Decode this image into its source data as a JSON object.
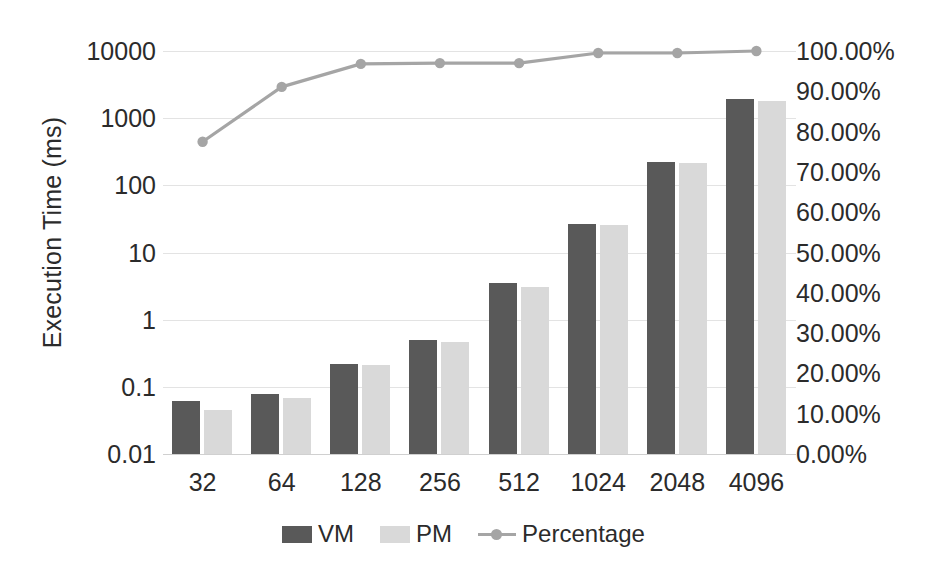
{
  "chart_data": {
    "type": "bar",
    "title": "",
    "subtitle": "",
    "xlabel": "",
    "ylabel": "Execution Time (ms)",
    "y2label": "",
    "categories": [
      "32",
      "64",
      "128",
      "256",
      "512",
      "1024",
      "2048",
      "4096"
    ],
    "yscale": "log",
    "ylim": [
      0.01,
      10000
    ],
    "ytick_labels": [
      "10000",
      "1000",
      "100",
      "10",
      "1",
      "0.1",
      "0.01"
    ],
    "ytick_values": [
      10000,
      1000,
      100,
      10,
      1,
      0.1,
      0.01
    ],
    "y2lim": [
      0,
      100
    ],
    "y2tick_labels": [
      "100.00%",
      "90.00%",
      "80.00%",
      "70.00%",
      "60.00%",
      "50.00%",
      "40.00%",
      "30.00%",
      "20.00%",
      "10.00%",
      "0.00%"
    ],
    "y2tick_values": [
      100,
      90,
      80,
      70,
      60,
      50,
      40,
      30,
      20,
      10,
      0
    ],
    "grid": true,
    "legend_position": "bottom",
    "series": [
      {
        "name": "VM",
        "type": "bar",
        "axis": "left",
        "color": "#595959",
        "values": [
          0.062,
          0.078,
          0.22,
          0.49,
          3.5,
          27,
          220,
          1900
        ]
      },
      {
        "name": "PM",
        "type": "bar",
        "axis": "left",
        "color": "#d9d9d9",
        "values": [
          0.045,
          0.068,
          0.21,
          0.46,
          3.1,
          26,
          215,
          1830
        ]
      },
      {
        "name": "Percentage",
        "type": "line",
        "axis": "right",
        "color": "#a5a5a5",
        "values": [
          77.5,
          91.1,
          96.8,
          97.0,
          97.0,
          99.5,
          99.5,
          100.0
        ]
      }
    ]
  },
  "legend": {
    "items": [
      {
        "label": "VM",
        "marker": "square-swatch",
        "color": "#595959"
      },
      {
        "label": "PM",
        "marker": "square-swatch",
        "color": "#d9d9d9"
      },
      {
        "label": "Percentage",
        "marker": "line-marker",
        "color": "#a5a5a5"
      }
    ]
  },
  "colors": {
    "vm": "#595959",
    "pm": "#d9d9d9",
    "percentage": "#a5a5a5",
    "gridline": "#e3e3e3",
    "text": "#2b2b2b",
    "background": "#ffffff"
  }
}
